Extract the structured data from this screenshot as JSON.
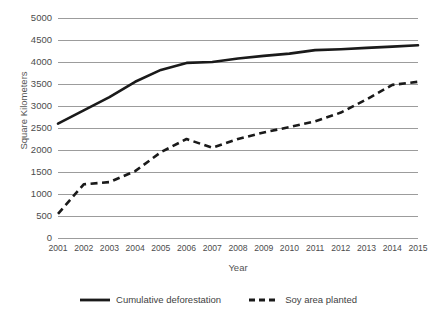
{
  "chart_data": {
    "type": "line",
    "title": "",
    "subtitle": "",
    "xlabel": "Year",
    "ylabel": "Square Kilometers",
    "categories": [
      "2001",
      "2002",
      "2003",
      "2004",
      "2005",
      "2006",
      "2007",
      "2008",
      "2009",
      "2010",
      "2011",
      "2012",
      "2013",
      "2014",
      "2015"
    ],
    "series": [
      {
        "name": "Cumulative deforestation",
        "style": "solid",
        "color": "#1a1a1a",
        "values": [
          2600,
          2900,
          3200,
          3550,
          3820,
          3980,
          4000,
          4080,
          4140,
          4190,
          4270,
          4290,
          4320,
          4350,
          4380
        ]
      },
      {
        "name": "Soy area planted",
        "style": "dashed",
        "color": "#1a1a1a",
        "values": [
          550,
          1220,
          1270,
          1520,
          1950,
          2250,
          2050,
          2250,
          2400,
          2520,
          2650,
          2850,
          3150,
          3480,
          3550
        ]
      }
    ],
    "ylim": [
      0,
      5000
    ],
    "yticks": [
      0,
      500,
      1000,
      1500,
      2000,
      2500,
      3000,
      3500,
      4000,
      4500,
      5000
    ],
    "ytick_labels": [
      "0",
      "500",
      "1000",
      "1500",
      "2000",
      "2500",
      "3000",
      "3500",
      "4000",
      "4500",
      "5000"
    ],
    "grid": true,
    "grid_axis": "y",
    "grid_color": "#9c9c9c",
    "legend_position": "bottom",
    "legend": [
      "Cumulative deforestation",
      "Soy area planted"
    ],
    "annotations": []
  },
  "axes": {
    "y_title": "Square Kilometers",
    "x_title": "Year"
  },
  "legend_items": [
    {
      "label": "Cumulative deforestation",
      "style": "solid"
    },
    {
      "label": "Soy area planted",
      "style": "dashed"
    }
  ]
}
